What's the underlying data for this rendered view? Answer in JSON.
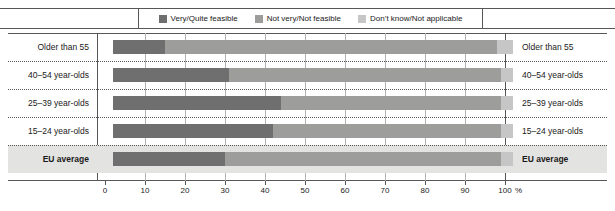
{
  "chart_data": {
    "type": "bar",
    "subtype": "stacked-horizontal-100",
    "title": "",
    "xlabel": "%",
    "ylabel": "",
    "xlim": [
      0,
      100
    ],
    "grid": true,
    "legend_position": "top",
    "categories": [
      "Older than 55",
      "40–54 year-olds",
      "25–39 year-olds",
      "15–24 year-olds",
      "EU average"
    ],
    "series": [
      {
        "name": "Very/Quite feasible",
        "color": "#706f6f",
        "values": [
          13,
          29,
          42,
          40,
          28
        ]
      },
      {
        "name": "Not very/Not feasible",
        "color": "#9d9d9c",
        "values": [
          83,
          68,
          55,
          57,
          69
        ]
      },
      {
        "name": "Don’t know/Not applicable",
        "color": "#c6c6c6",
        "values": [
          4,
          3,
          3,
          3,
          3
        ]
      }
    ],
    "xticks": [
      0,
      10,
      20,
      30,
      40,
      50,
      60,
      70,
      80,
      90,
      100
    ],
    "xtick_labels": [
      "0",
      "10",
      "20",
      "30",
      "40",
      "50",
      "60",
      "70",
      "80",
      "90",
      "100"
    ],
    "axis_unit": "%"
  },
  "legend": {
    "items": [
      {
        "label": "Very/Quite feasible",
        "color": "#706f6f"
      },
      {
        "label": "Not very/Not feasible",
        "color": "#9d9d9c"
      },
      {
        "label": "Don’t know/Not applicable",
        "color": "#c6c6c6"
      }
    ]
  },
  "rows": [
    {
      "label": "Older than 55",
      "emphasis": false
    },
    {
      "label": "40–54 year-olds",
      "emphasis": false
    },
    {
      "label": "25–39 year-olds",
      "emphasis": false
    },
    {
      "label": "15–24 year-olds",
      "emphasis": false
    },
    {
      "label": "EU average",
      "emphasis": true
    }
  ]
}
